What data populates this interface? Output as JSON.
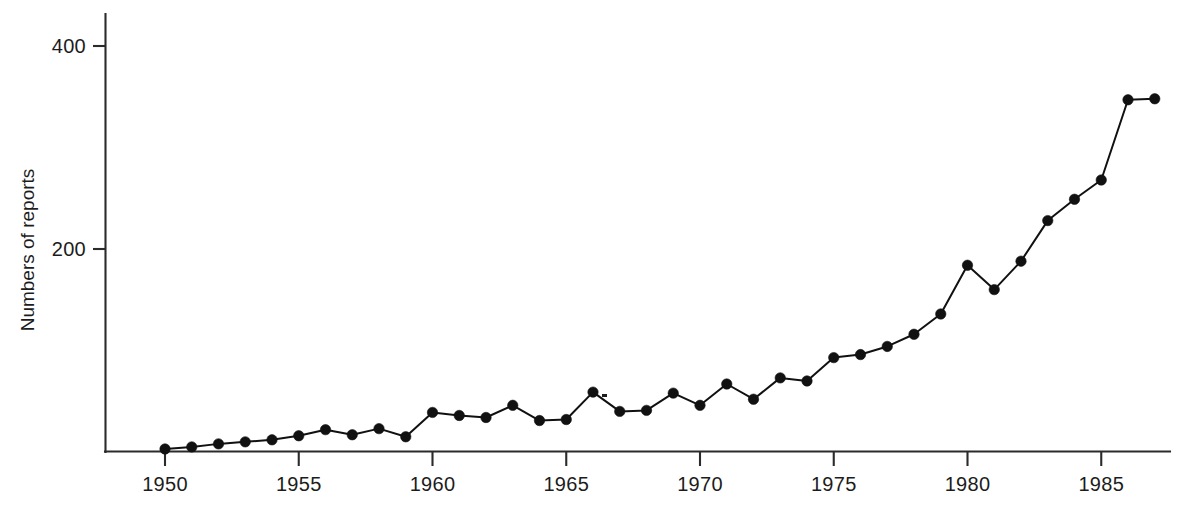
{
  "chart_data": {
    "type": "line",
    "title": "",
    "xlabel": "",
    "ylabel": "Numbers of reports",
    "xlim": [
      1948.6,
      1987.8
    ],
    "ylim": [
      0,
      440
    ],
    "grid": false,
    "legend": "none",
    "x_ticks": [
      1950,
      1955,
      1960,
      1965,
      1970,
      1975,
      1980,
      1985
    ],
    "x_tick_labels": [
      "1950",
      "1955",
      "1960",
      "1965",
      "1970",
      "1975",
      "1980",
      "1985"
    ],
    "y_ticks": [
      200,
      400
    ],
    "y_tick_labels": [
      "200",
      "400"
    ],
    "marker": "filled-circle",
    "marker_color": "#111111",
    "line_color": "#111111",
    "x": [
      1950,
      1951,
      1952,
      1953,
      1954,
      1955,
      1956,
      1957,
      1958,
      1959,
      1960,
      1961,
      1962,
      1963,
      1964,
      1965,
      1966,
      1967,
      1968,
      1969,
      1970,
      1971,
      1972,
      1973,
      1974,
      1975,
      1976,
      1977,
      1978,
      1979,
      1980,
      1981,
      1982,
      1983,
      1984,
      1985,
      1986,
      1987
    ],
    "values": [
      3,
      5,
      8,
      10,
      12,
      16,
      22,
      17,
      23,
      15,
      39,
      36,
      34,
      46,
      31,
      32,
      59,
      40,
      41,
      58,
      46,
      67,
      52,
      73,
      70,
      93,
      96,
      104,
      116,
      136,
      184,
      160,
      188,
      228,
      249,
      268,
      347,
      348
    ],
    "series": [
      {
        "name": "Numbers of reports",
        "values": [
          3,
          5,
          8,
          10,
          12,
          16,
          22,
          17,
          23,
          15,
          39,
          36,
          34,
          46,
          31,
          32,
          59,
          40,
          41,
          58,
          46,
          67,
          52,
          73,
          70,
          93,
          96,
          104,
          116,
          136,
          184,
          160,
          188,
          228,
          249,
          268,
          347,
          348
        ]
      }
    ],
    "annotations": []
  },
  "axes": {
    "y_axis_title": "Numbers of reports"
  }
}
